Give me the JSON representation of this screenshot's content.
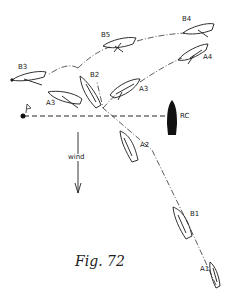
{
  "figure": {
    "caption": "Fig. 72",
    "labels": {
      "b1": "B1",
      "a1": "A1",
      "a2": "A2",
      "b2": "B2",
      "a3_right": "A3",
      "a3_left": "A3",
      "b3": "B3",
      "b5": "B5",
      "b4": "B4",
      "a4": "A4",
      "rc": "RC",
      "wind": "wind"
    },
    "elements": {
      "mark": "flag-buoy-icon",
      "committee_boat": "RC",
      "start_line": "dashed line from mark to committee boat",
      "wind_direction": "down"
    },
    "colors": {
      "ink": "#1a1a1a",
      "background": "#ffffff"
    }
  }
}
